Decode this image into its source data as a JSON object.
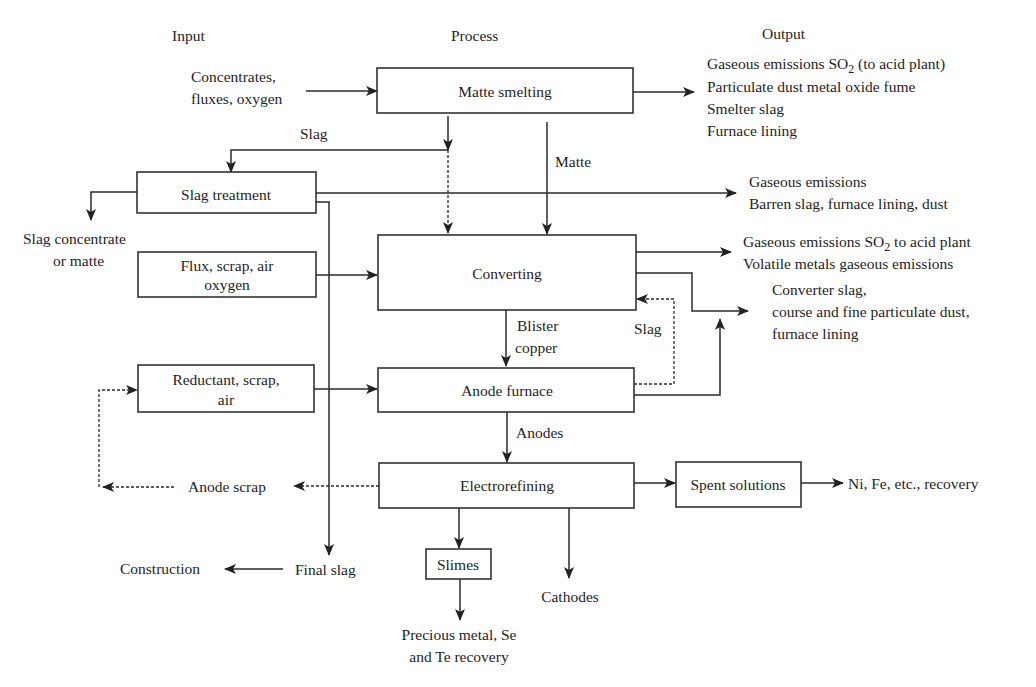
{
  "headers": {
    "input": "Input",
    "process": "Process",
    "output": "Output"
  },
  "inputs": {
    "concentrates": [
      "Concentrates,",
      "fluxes, oxygen"
    ],
    "flux_box": [
      "Flux, scrap, air",
      "oxygen"
    ],
    "reductant_box": [
      "Reductant, scrap,",
      "air"
    ]
  },
  "process": {
    "matte_smelting": "Matte smelting",
    "slag_treatment": "Slag treatment",
    "converting": "Converting",
    "anode_furnace": "Anode furnace",
    "electrorefining": "Electrorefining",
    "spent_solutions": "Spent solutions",
    "slimes": "Slimes"
  },
  "flow_labels": {
    "slag_top": "Slag",
    "matte": "Matte",
    "blister_copper": [
      "Blister",
      "copper"
    ],
    "slag_return": "Slag",
    "anodes": "Anodes",
    "anode_scrap": "Anode scrap",
    "final_slag": "Final slag"
  },
  "outputs": {
    "smelting": {
      "line1_prefix": "Gaseous emissions SO",
      "line1_sub": "2",
      "line1_suffix": " (to acid plant)",
      "lines": [
        "Particulate dust metal oxide fume",
        "Smelter slag",
        "Furnace lining"
      ]
    },
    "slag_treatment": [
      "Gaseous emissions",
      "Barren slag, furnace lining, dust"
    ],
    "converting": {
      "line1_prefix": "Gaseous emissions SO",
      "line1_sub": "2",
      "line1_suffix": " to acid plant",
      "line2": "Volatile metals gaseous emissions"
    },
    "converter_slag": [
      "Converter slag,",
      "course and fine particulate dust,",
      "furnace lining"
    ],
    "slag_concentrate": [
      "Slag concentrate",
      "or matte"
    ],
    "construction": "Construction",
    "cathodes": "Cathodes",
    "precious_metal": [
      "Precious metal, Se",
      "and Te recovery"
    ],
    "ni_fe_recovery": "Ni, Fe, etc., recovery"
  }
}
